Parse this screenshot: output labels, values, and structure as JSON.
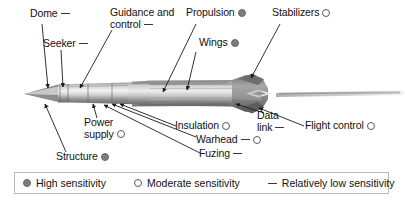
{
  "figure": {
    "type": "labeled-technical-diagram"
  },
  "callouts": [
    {
      "id": "dome",
      "label": "Dome",
      "marker": "low"
    },
    {
      "id": "seeker",
      "label": "Seeker",
      "marker": "low"
    },
    {
      "id": "guidance",
      "label_line1": "Guidance and",
      "label_line2": "control",
      "marker": "low"
    },
    {
      "id": "propulsion",
      "label": "Propulsion",
      "marker": "high"
    },
    {
      "id": "wings",
      "label": "Wings",
      "marker": "high"
    },
    {
      "id": "stabilizers",
      "label": "Stabilizers",
      "marker": "moderate"
    },
    {
      "id": "power-supply",
      "label_line1": "Power",
      "label_line2": "supply",
      "marker": "moderate"
    },
    {
      "id": "structure",
      "label": "Structure",
      "marker": "high"
    },
    {
      "id": "insulation",
      "label": "Insulation",
      "marker": "moderate"
    },
    {
      "id": "warhead",
      "label": "Warhead",
      "marker": "low-moderate"
    },
    {
      "id": "fuzing",
      "label": "Fuzing",
      "marker": "low"
    },
    {
      "id": "data-link",
      "label_line1": "Data",
      "label_line2": "link",
      "marker": "low"
    },
    {
      "id": "flight-control",
      "label": "Flight control",
      "marker": "moderate"
    }
  ],
  "legend": {
    "items": [
      {
        "id": "high",
        "marker": "high",
        "label": "High sensitivity"
      },
      {
        "id": "moderate",
        "marker": "moderate",
        "label": "Moderate sensitivity"
      },
      {
        "id": "low",
        "marker": "low",
        "label": "Relatively low sensitivity"
      }
    ]
  },
  "colors": {
    "marker_high_fill": "#7d7d7d",
    "marker_moderate_stroke": "#5a5a5a",
    "marker_low_stroke": "#3a3a3a",
    "legend_border": "#b9b9b9",
    "text": "#111111",
    "body_light": "#e8e8e8",
    "body_mid": "#b4b4b4",
    "body_dark": "#6f6f6f"
  }
}
